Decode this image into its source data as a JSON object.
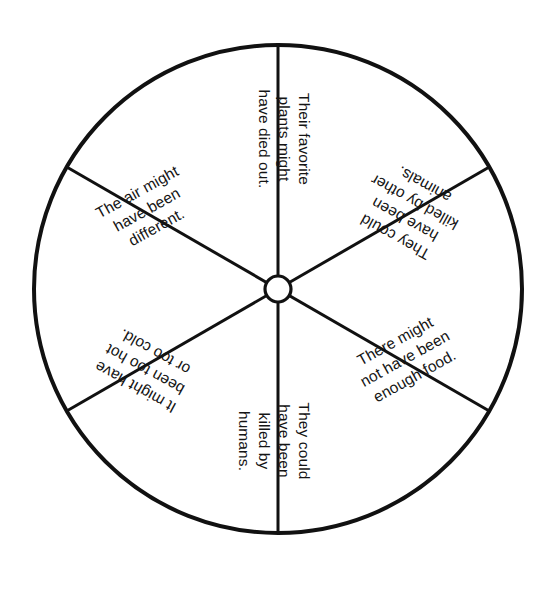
{
  "page": {
    "background_color": "#ffffff",
    "width": 548,
    "height": 596
  },
  "wheel": {
    "type": "spinner-wheel",
    "stroke_color": "#111111",
    "fill_color": "#ffffff",
    "outer_stroke_width": 4,
    "spoke_stroke_width": 3,
    "center_x": 278,
    "center_y": 289,
    "radius": 244,
    "hub_radius": 13,
    "segment_count": 6,
    "segment_angles_deg": [
      30,
      90,
      150,
      210,
      270,
      330
    ],
    "segments": [
      {
        "id": "segment-1",
        "position": "top-right",
        "text": "The air might\nhave been\ndifferent.",
        "orientation": "rotated-clockwise",
        "upside_down": false
      },
      {
        "id": "segment-2",
        "position": "right",
        "text": "Their favorite\nplants might\nhave died out.",
        "orientation": "rotated-clockwise",
        "upside_down": false
      },
      {
        "id": "segment-3",
        "position": "bottom-right",
        "text": "They could\nhave been\nkilled by other\nanimals.",
        "orientation": "rotated-clockwise",
        "upside_down": true
      },
      {
        "id": "segment-4",
        "position": "bottom-left",
        "text": "There might\nnot have been\nenough food.",
        "orientation": "rotated-clockwise",
        "upside_down": true
      },
      {
        "id": "segment-5",
        "position": "left",
        "text": "They could\nhave been\nkilled by\nhumans.",
        "orientation": "rotated-counterclockwise",
        "upside_down": false
      },
      {
        "id": "segment-6",
        "position": "top-left",
        "text": "It might have\nbeen too hot\nor too cold.",
        "orientation": "rotated-counterclockwise",
        "upside_down": false
      }
    ]
  }
}
